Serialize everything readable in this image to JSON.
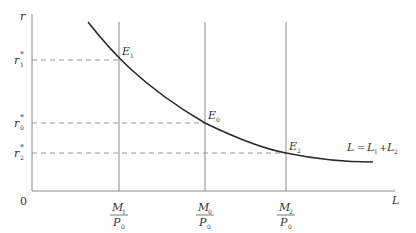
{
  "diagram": {
    "axes": {
      "y_label": "r",
      "x_label": "L",
      "origin_label": "0"
    },
    "y_ticks": [
      {
        "base": "r",
        "sub": "1",
        "sup": "*",
        "y": 60
      },
      {
        "base": "r",
        "sub": "0",
        "sup": "*",
        "y": 123
      },
      {
        "base": "r",
        "sub": "2",
        "sup": "*",
        "y": 153
      }
    ],
    "x_ticks": [
      {
        "num": "M",
        "num_sub": "1",
        "den": "P",
        "den_sub": "0",
        "x": 119
      },
      {
        "num": "M",
        "num_sub": "0",
        "den": "P",
        "den_sub": "0",
        "x": 205
      },
      {
        "num": "M",
        "num_sub": "2",
        "den": "P",
        "den_sub": "0",
        "x": 286
      }
    ],
    "points": [
      {
        "base": "E",
        "sub": "1"
      },
      {
        "base": "E",
        "sub": "0"
      },
      {
        "base": "E",
        "sub": "2"
      }
    ],
    "curve_label": {
      "lhs": "L",
      "eq": "=",
      "t1": "L",
      "t1_sub": "1",
      "plus": "+",
      "t2": "L",
      "t2_sub": "2"
    },
    "colors": {
      "curve": "#2a2a2a",
      "axis": "#8a8a8a",
      "dashed": "#9a9a9a"
    }
  }
}
